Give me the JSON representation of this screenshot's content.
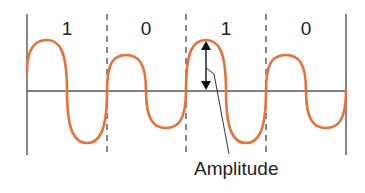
{
  "diagram": {
    "type": "amplitude-modulation-waveform",
    "bits": [
      {
        "label": "1",
        "amplitude": "high"
      },
      {
        "label": "0",
        "amplitude": "low"
      },
      {
        "label": "1",
        "amplitude": "high"
      },
      {
        "label": "0",
        "amplitude": "low"
      }
    ],
    "annotation": "Amplitude",
    "colors": {
      "wave": "#e8703a",
      "axis": "#555555",
      "text": "#222222"
    }
  }
}
